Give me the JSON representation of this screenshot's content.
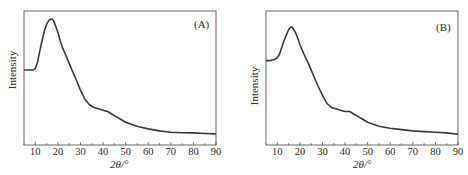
{
  "chart_data": [
    {
      "type": "line",
      "panel_label": "(A)",
      "title": "",
      "xlabel": "2θ/°",
      "ylabel": "Intensity",
      "xlim": [
        5,
        90
      ],
      "ylim": [
        0,
        100
      ],
      "xticks": [
        10,
        20,
        30,
        40,
        50,
        60,
        70,
        80,
        90
      ],
      "yticks": [],
      "grid": false,
      "legend": null,
      "series": [
        {
          "name": "A",
          "x": [
            5,
            7,
            9,
            10,
            11,
            12,
            13,
            14,
            15,
            16,
            17,
            17.5,
            18,
            19,
            20,
            21,
            22,
            24,
            26,
            28,
            30,
            32,
            34,
            36,
            38,
            40,
            42,
            44,
            46,
            48,
            50,
            55,
            60,
            65,
            70,
            75,
            80,
            85,
            90
          ],
          "values": [
            56,
            56,
            56,
            57,
            62,
            70,
            78,
            85,
            90,
            93,
            94,
            94,
            93,
            89,
            84,
            78,
            73,
            65,
            57,
            49,
            41,
            34,
            30,
            28,
            27,
            26,
            25,
            23,
            21,
            19,
            17,
            14,
            12,
            10.5,
            9.5,
            9.2,
            9,
            8.6,
            8.3
          ]
        }
      ]
    },
    {
      "type": "line",
      "panel_label": "(B)",
      "title": "",
      "xlabel": "2θ/°",
      "ylabel": "Intensity",
      "xlim": [
        5,
        90
      ],
      "ylim": [
        0,
        100
      ],
      "xticks": [
        10,
        20,
        30,
        40,
        50,
        60,
        70,
        80,
        90
      ],
      "yticks": [],
      "grid": false,
      "legend": null,
      "series": [
        {
          "name": "B",
          "x": [
            5,
            7,
            9,
            10,
            11,
            12,
            13,
            14,
            15,
            16,
            16.5,
            17,
            18,
            19,
            20,
            21,
            22,
            24,
            26,
            28,
            30,
            32,
            34,
            36,
            38,
            40,
            42,
            44,
            46,
            48,
            50,
            55,
            60,
            65,
            70,
            75,
            80,
            85,
            90
          ],
          "values": [
            63,
            63,
            64,
            65,
            68,
            73,
            78,
            82,
            86,
            88,
            88,
            87,
            84,
            80,
            75,
            71,
            67,
            60,
            52,
            44,
            37,
            31,
            28,
            27,
            26,
            25,
            25,
            23,
            21,
            19,
            17,
            14,
            12.5,
            11.5,
            10.5,
            10,
            9.5,
            9,
            8
          ]
        }
      ]
    }
  ],
  "panels": [
    {
      "tag": "(A)",
      "xlabel": "2θ/°",
      "ylabel": "Intensity",
      "ticks": [
        "10",
        "20",
        "30",
        "40",
        "50",
        "60",
        "70",
        "80",
        "90"
      ]
    },
    {
      "tag": "(B)",
      "xlabel": "2θ/°",
      "ylabel": "Intensity",
      "ticks": [
        "10",
        "20",
        "30",
        "40",
        "50",
        "60",
        "70",
        "80",
        "90"
      ]
    }
  ],
  "colors": {
    "line": "#3a3a3a",
    "axis": "#555555",
    "background": "#ffffff"
  }
}
